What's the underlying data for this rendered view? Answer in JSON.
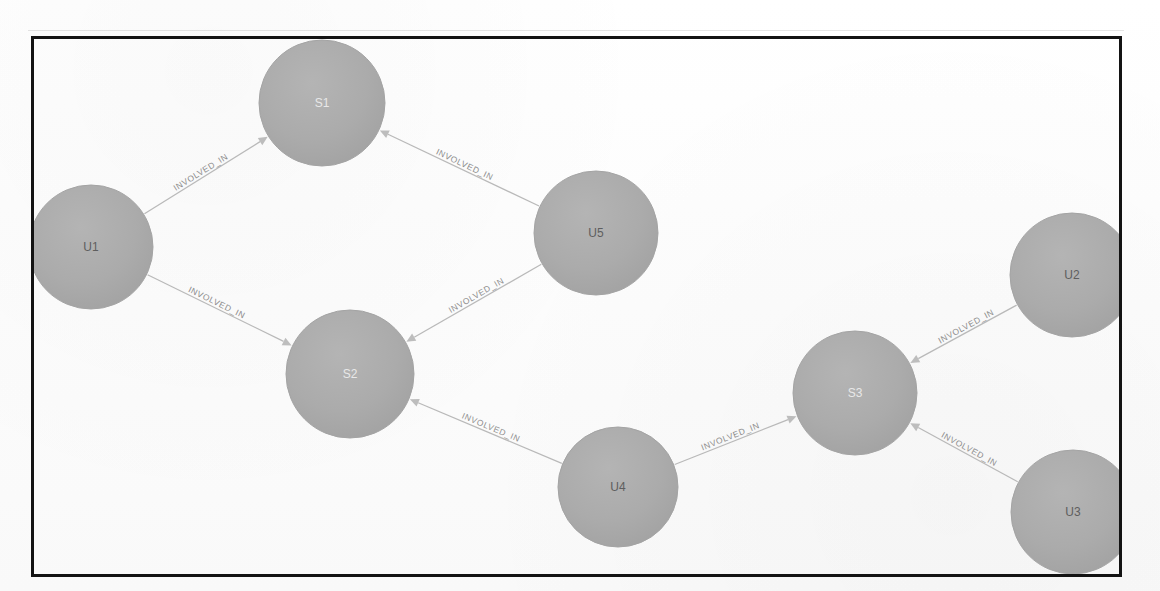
{
  "figure": {
    "kind": "graph-visualization",
    "frame": {
      "border_color": "#131313",
      "background": "#ffffff"
    },
    "node_fill_color": "#ababab",
    "edge_color": "#b9b9b9",
    "user_label_color": "#5e5e5e",
    "service_label_color": "#e8e8e8"
  },
  "graph": {
    "nodes": [
      {
        "id": "U1",
        "label": "U1",
        "type": "user",
        "cx": 91,
        "cy": 247,
        "r": 62
      },
      {
        "id": "S1",
        "label": "S1",
        "type": "service",
        "cx": 322,
        "cy": 103,
        "r": 63
      },
      {
        "id": "U5",
        "label": "U5",
        "type": "user",
        "cx": 596,
        "cy": 233,
        "r": 62
      },
      {
        "id": "S2",
        "label": "S2",
        "type": "service",
        "cx": 350,
        "cy": 374,
        "r": 64
      },
      {
        "id": "U4",
        "label": "U4",
        "type": "user",
        "cx": 618,
        "cy": 487,
        "r": 60
      },
      {
        "id": "S3",
        "label": "S3",
        "type": "service",
        "cx": 855,
        "cy": 393,
        "r": 62
      },
      {
        "id": "U2",
        "label": "U2",
        "type": "user",
        "cx": 1072,
        "cy": 275,
        "r": 62
      },
      {
        "id": "U3",
        "label": "U3",
        "type": "user",
        "cx": 1073,
        "cy": 512,
        "r": 62
      }
    ],
    "edges": [
      {
        "from": "U1",
        "to": "S1",
        "label": "INVOLVED_IN"
      },
      {
        "from": "U5",
        "to": "S1",
        "label": "INVOLVED_IN"
      },
      {
        "from": "U1",
        "to": "S2",
        "label": "INVOLVED_IN"
      },
      {
        "from": "U5",
        "to": "S2",
        "label": "INVOLVED_IN"
      },
      {
        "from": "U4",
        "to": "S2",
        "label": "INVOLVED_IN"
      },
      {
        "from": "U4",
        "to": "S3",
        "label": "INVOLVED_IN"
      },
      {
        "from": "U2",
        "to": "S3",
        "label": "INVOLVED_IN"
      },
      {
        "from": "U3",
        "to": "S3",
        "label": "INVOLVED_IN"
      }
    ]
  }
}
